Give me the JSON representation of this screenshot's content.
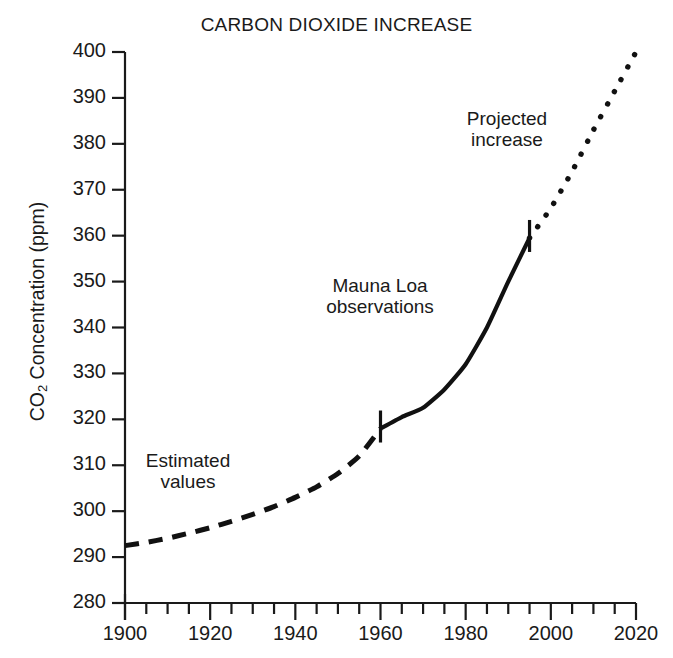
{
  "chart_data": {
    "type": "line",
    "title": "CARBON DIOXIDE INCREASE",
    "xlabel": "",
    "ylabel": "CO2 Concentration (ppm)",
    "ylabel_prefix": "CO",
    "ylabel_sub": "2",
    "ylabel_suffix": " Concentration (ppm)",
    "xlim": [
      1900,
      2020
    ],
    "ylim": [
      280,
      400
    ],
    "grid": false,
    "legend_position": "none",
    "xticks": [
      1900,
      1920,
      1940,
      1960,
      1980,
      2000,
      2020
    ],
    "xtick_labels": [
      "1900",
      "1920",
      "1940",
      "1960",
      "1980",
      "2000",
      "2020"
    ],
    "x_minor_tick_step": 5,
    "yticks": [
      280,
      290,
      300,
      310,
      320,
      330,
      340,
      350,
      360,
      370,
      380,
      390,
      400
    ],
    "ytick_labels": [
      "280",
      "290",
      "300",
      "310",
      "320",
      "330",
      "340",
      "350",
      "360",
      "370",
      "380",
      "390",
      "400"
    ],
    "series": [
      {
        "name": "Estimated values",
        "style": "dashed",
        "color": "#111111",
        "x": [
          1900,
          1905,
          1910,
          1915,
          1920,
          1925,
          1930,
          1935,
          1940,
          1945,
          1950,
          1955,
          1960
        ],
        "values": [
          292.5,
          293.2,
          294.1,
          295.2,
          296.4,
          297.8,
          299.3,
          301.0,
          303.0,
          305.3,
          308.2,
          312.0,
          318.0
        ]
      },
      {
        "name": "Mauna Loa observations",
        "style": "solid",
        "color": "#111111",
        "x": [
          1960,
          1965,
          1970,
          1975,
          1980,
          1985,
          1990,
          1995
        ],
        "values": [
          318.0,
          320.5,
          322.5,
          326.5,
          332.0,
          340.0,
          350.0,
          359.5
        ]
      },
      {
        "name": "Projected increase",
        "style": "dotted",
        "color": "#111111",
        "x": [
          1995,
          2000,
          2005,
          2010,
          2015,
          2020
        ],
        "values": [
          359.5,
          366.0,
          374.0,
          383.0,
          391.5,
          400.0
        ]
      }
    ],
    "annotations": [
      {
        "id": "estimated",
        "text": "Estimated\nvalues",
        "x": 1911,
        "y": 313
      },
      {
        "id": "mauna",
        "text": "Mauna Loa\nobservations",
        "x": 1953,
        "y": 350
      },
      {
        "id": "projected",
        "text": "Projected\nincrease",
        "x": 1984,
        "y": 382
      }
    ],
    "segment_markers": [
      {
        "label": "1960",
        "x": 1960,
        "y": 318.0
      },
      {
        "label": "1995",
        "x": 1995,
        "y": 359.5
      }
    ]
  }
}
